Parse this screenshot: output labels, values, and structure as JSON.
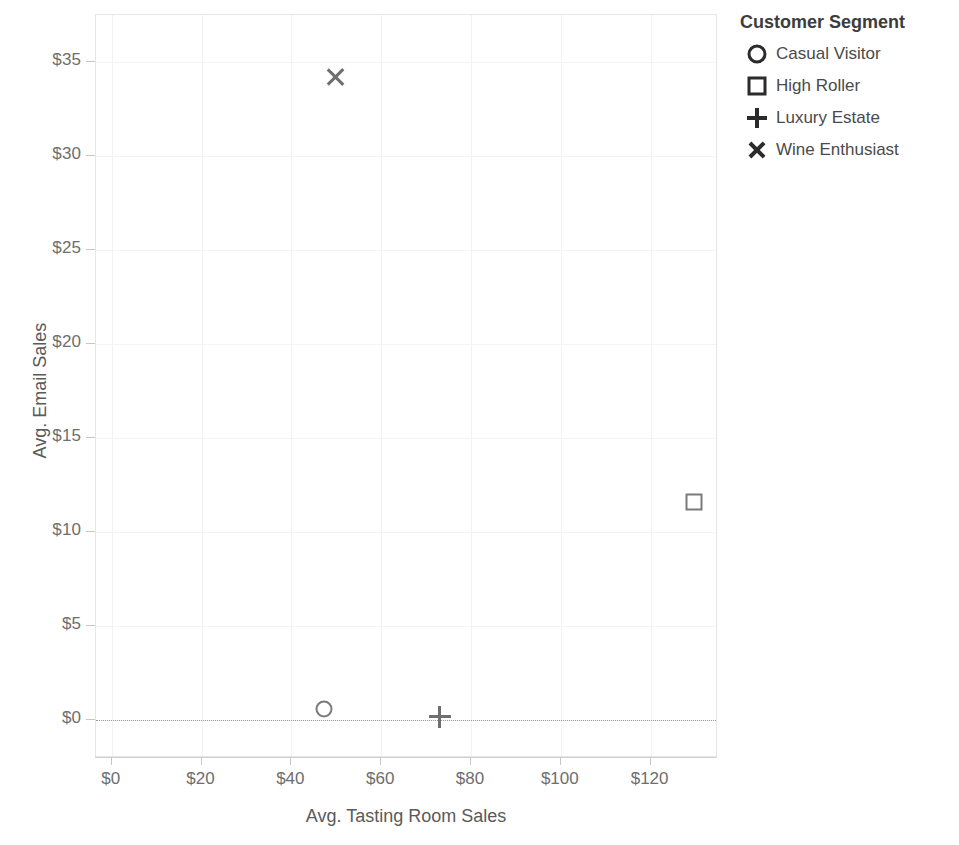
{
  "chart_data": {
    "type": "scatter",
    "title": "",
    "xlabel": "Avg. Tasting Room Sales",
    "ylabel": "Avg. Email Sales",
    "xlim": [
      -3.5,
      135
    ],
    "ylim": [
      -2.0,
      37.5
    ],
    "xticks": [
      0,
      20,
      40,
      60,
      80,
      100,
      120
    ],
    "xtick_labels": [
      "$0",
      "$20",
      "$40",
      "$60",
      "$80",
      "$100",
      "$120"
    ],
    "yticks": [
      0,
      5,
      10,
      15,
      20,
      25,
      30,
      35
    ],
    "ytick_labels": [
      "$0",
      "$5",
      "$10",
      "$15",
      "$20",
      "$25",
      "$30",
      "$35"
    ],
    "grid": true,
    "zero_reference_line": 0,
    "legend_position": "right",
    "legend_title": "Customer Segment",
    "series": [
      {
        "name": "Casual Visitor",
        "marker": "circle",
        "color": "#7a7a7a",
        "points": [
          {
            "x": 47.3,
            "y": 0.6
          }
        ]
      },
      {
        "name": "High Roller",
        "marker": "square",
        "color": "#7a7a7a",
        "points": [
          {
            "x": 129.6,
            "y": 11.6
          }
        ]
      },
      {
        "name": "Luxury Estate",
        "marker": "plus",
        "color": "#7a7a7a",
        "points": [
          {
            "x": 73.0,
            "y": 0.2
          }
        ]
      },
      {
        "name": "Wine Enthusiast",
        "marker": "cross",
        "color": "#7a7a7a",
        "points": [
          {
            "x": 49.8,
            "y": 34.2
          }
        ]
      }
    ]
  },
  "axes": {
    "x_title": "Avg. Tasting Room Sales",
    "y_title": "Avg. Email Sales",
    "x_labels": [
      "$0",
      "$20",
      "$40",
      "$60",
      "$80",
      "$100",
      "$120"
    ],
    "y_labels": [
      "$0",
      "$5",
      "$10",
      "$15",
      "$20",
      "$25",
      "$30",
      "$35"
    ]
  },
  "legend": {
    "title": "Customer Segment",
    "items": [
      {
        "label": "Casual Visitor",
        "glyph": "circle-marker-icon"
      },
      {
        "label": "High Roller",
        "glyph": "square-marker-icon"
      },
      {
        "label": "Luxury Estate",
        "glyph": "plus-marker-icon"
      },
      {
        "label": "Wine Enthusiast",
        "glyph": "cross-marker-icon"
      }
    ]
  },
  "colors": {
    "marker": "#7a7a7a",
    "legend_glyph": "#2b2b2b",
    "axis_text": "#6e6e6e",
    "grid": "#f2f2f2"
  }
}
